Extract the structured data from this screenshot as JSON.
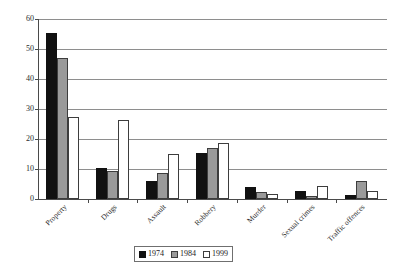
{
  "chart_data": {
    "type": "bar",
    "title": "",
    "xlabel": "",
    "ylabel": "",
    "ylim": [
      0,
      60
    ],
    "yticks": [
      0,
      10,
      20,
      30,
      40,
      50,
      60
    ],
    "grid": true,
    "legend_position": "bottom",
    "categories": [
      "Property",
      "Drugs",
      "Assault",
      "Robbery",
      "Murder",
      "Sexual crimes",
      "Traffic offences"
    ],
    "series": [
      {
        "name": "1974",
        "color": "#111111",
        "values": [
          55.3,
          10.2,
          6.0,
          15.2,
          4.1,
          2.6,
          1.3
        ]
      },
      {
        "name": "1984",
        "color": "#9a9a9a",
        "values": [
          47.0,
          9.5,
          8.8,
          16.9,
          2.4,
          1.0,
          6.1
        ]
      },
      {
        "name": "1999",
        "color": "#ffffff",
        "values": [
          27.5,
          26.5,
          15.0,
          18.8,
          1.8,
          4.5,
          2.8
        ]
      }
    ]
  },
  "axis": {
    "ytick_labels": [
      "0",
      "10",
      "20",
      "30",
      "40",
      "50",
      "60"
    ]
  },
  "legend": {
    "items": [
      {
        "label": "1974"
      },
      {
        "label": "1984"
      },
      {
        "label": "1999"
      }
    ]
  }
}
